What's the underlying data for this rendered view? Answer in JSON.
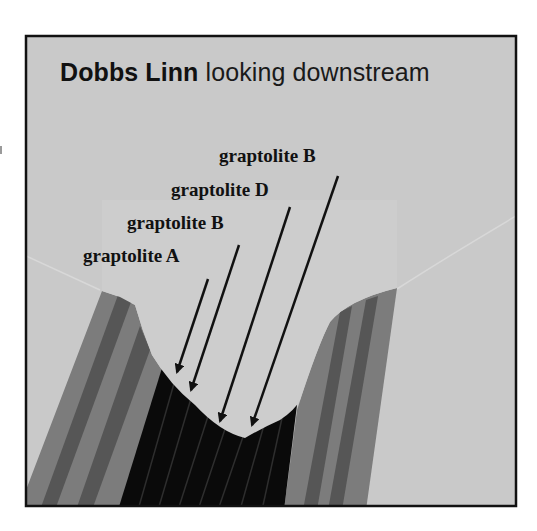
{
  "figure": {
    "title": {
      "bold": "Dobbs Linn",
      "regular": " looking downstream"
    },
    "labels": [
      {
        "id": "label-graptolite-b-upper",
        "text": "graptolite B"
      },
      {
        "id": "label-graptolite-d",
        "text": "graptolite D"
      },
      {
        "id": "label-graptolite-b-lower",
        "text": "graptolite B"
      },
      {
        "id": "label-graptolite-a",
        "text": "graptolite A"
      }
    ],
    "colors": {
      "background": "#c9c9c9",
      "valley": "#cdcdcd",
      "border": "#111111",
      "strata_medium": "#7c7c7c",
      "strata_dark": "#565656",
      "strata_black": "#0a0a0a",
      "strata_black_lines": "#2e2e2e",
      "arrow": "#111111"
    }
  }
}
